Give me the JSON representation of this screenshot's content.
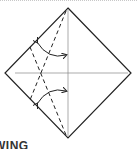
{
  "diagram": {
    "type": "origami-fold-step",
    "caption": "WING",
    "colors": {
      "line": "#222222",
      "guide": "#888888",
      "border": "#c8c8c8"
    },
    "shapes": {
      "diamond": "square-rotated-45",
      "crease_lines": [
        "vertical-center",
        "horizontal-center"
      ],
      "dashed_fold_lines": 2,
      "fold_arrows": 2
    }
  }
}
